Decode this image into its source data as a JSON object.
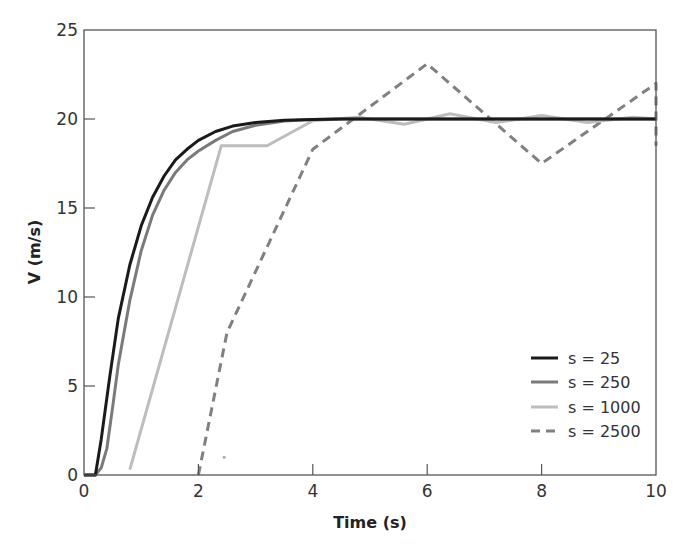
{
  "chart_data": {
    "type": "line",
    "title": "",
    "xlabel": "Time (s)",
    "ylabel": "V (m/s)",
    "xlim": [
      0,
      10
    ],
    "ylim": [
      0,
      25
    ],
    "xticks": [
      0,
      2,
      4,
      6,
      8,
      10
    ],
    "yticks": [
      0,
      5,
      10,
      15,
      20,
      25
    ],
    "xtick_labels": [
      "0",
      "2",
      "4",
      "6",
      "8",
      "10"
    ],
    "ytick_labels": [
      "0",
      "5",
      "10",
      "15",
      "20",
      "25"
    ],
    "grid": false,
    "legend_position": "lower right",
    "series": [
      {
        "name": "s = 25",
        "color": "#1a1a1a",
        "width": 3,
        "dash": "",
        "x": [
          0,
          0.2,
          0.3,
          0.45,
          0.6,
          0.8,
          1.0,
          1.2,
          1.4,
          1.6,
          1.8,
          2.0,
          2.3,
          2.6,
          3.0,
          3.5,
          4.0,
          4.5,
          5,
          6,
          7,
          8,
          9,
          10
        ],
        "y": [
          0,
          0,
          2.0,
          5.5,
          8.8,
          11.8,
          14.0,
          15.6,
          16.8,
          17.7,
          18.3,
          18.8,
          19.3,
          19.6,
          19.8,
          19.93,
          19.98,
          20,
          20,
          20,
          20,
          20,
          20,
          20
        ]
      },
      {
        "name": "s = 250",
        "color": "#7a7a7a",
        "width": 3,
        "dash": "",
        "x": [
          0,
          0.2,
          0.3,
          0.4,
          0.5,
          0.6,
          0.8,
          1.0,
          1.2,
          1.4,
          1.6,
          1.8,
          2.0,
          2.3,
          2.6,
          3.0,
          3.5,
          4.0,
          4.5,
          5,
          6,
          7,
          8,
          9,
          10
        ],
        "y": [
          0,
          0,
          0.4,
          1.5,
          3.8,
          6.2,
          9.8,
          12.6,
          14.6,
          16.0,
          17.0,
          17.7,
          18.2,
          18.8,
          19.3,
          19.65,
          19.88,
          19.97,
          20,
          20,
          20,
          20,
          20,
          20,
          20
        ]
      },
      {
        "name": "s = 1000",
        "color": "#bdbdbd",
        "width": 3,
        "dash": "",
        "x": [
          0.8,
          2.4,
          3.2,
          4.0,
          4.8,
          5.6,
          6.4,
          7.2,
          8.0,
          8.8,
          9.6,
          10
        ],
        "y": [
          0.3,
          18.5,
          18.5,
          19.9,
          20.1,
          19.7,
          20.3,
          19.8,
          20.2,
          19.8,
          20.1,
          20.0
        ]
      },
      {
        "name": "s = 2500",
        "color": "#808080",
        "width": 3,
        "dash": "9,6",
        "x": [
          2.0,
          2.5,
          4.0,
          6.0,
          8.0,
          10.0,
          10.0
        ],
        "y": [
          0,
          8.0,
          18.3,
          23.1,
          17.5,
          22.0,
          18.5
        ]
      }
    ],
    "annotations": [
      {
        "text": "",
        "x": 2.45,
        "y": 1.0,
        "kind": "stray dot",
        "color": "#aaaaaa"
      }
    ]
  },
  "legend": {
    "items": [
      {
        "label": "s = 25"
      },
      {
        "label": "s = 250"
      },
      {
        "label": "s = 1000"
      },
      {
        "label": "s = 2500"
      }
    ]
  },
  "axes": {
    "xlabel": "Time (s)",
    "ylabel": "V (m/s)"
  }
}
